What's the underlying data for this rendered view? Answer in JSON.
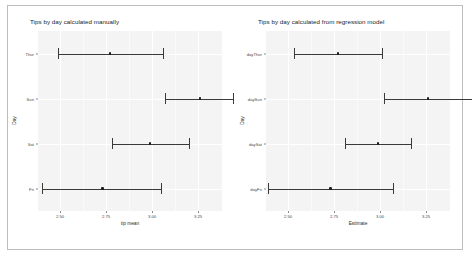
{
  "figure": {
    "background_color": "#ffffff",
    "border_color": "#bdbdbd",
    "panel_color": "#f4f4f4",
    "marker_color": "#1c1c1c",
    "line_color": "#3a3a3a"
  },
  "chart_data": [
    {
      "type": "scatter",
      "id": "manual",
      "title": "Tips by day calculated manually",
      "xlabel": "tip mean",
      "ylabel": "Day",
      "xlim": [
        2.38,
        3.38
      ],
      "grid": true,
      "legend": null,
      "xticks": [
        "2.50",
        "2.75",
        "3.00",
        "3.25"
      ],
      "xtick_values": [
        2.5,
        2.75,
        3.0,
        3.25
      ],
      "categories": [
        "Thur",
        "Sun",
        "Sat",
        "Fri"
      ],
      "series": [
        {
          "name": "tip mean with 95% CI",
          "points": [
            {
              "category": "Thur",
              "estimate": 2.77,
              "low": 2.49,
              "high": 3.06
            },
            {
              "category": "Sun",
              "estimate": 3.26,
              "low": 3.07,
              "high": 3.44
            },
            {
              "category": "Sat",
              "estimate": 2.99,
              "low": 2.78,
              "high": 3.2
            },
            {
              "category": "Fri",
              "estimate": 2.73,
              "low": 2.4,
              "high": 3.05
            }
          ]
        }
      ]
    },
    {
      "type": "scatter",
      "id": "regression",
      "title": "Tips by day calculated from regression model",
      "xlabel": "Estimate",
      "ylabel": "Day",
      "xlim": [
        2.38,
        3.38
      ],
      "grid": true,
      "legend": null,
      "xticks": [
        "2.50",
        "2.75",
        "3.00",
        "3.25"
      ],
      "xtick_values": [
        2.5,
        2.75,
        3.0,
        3.25
      ],
      "categories": [
        "dayThur",
        "daySun",
        "daySat",
        "dayFri"
      ],
      "series": [
        {
          "name": "Estimate with 95% CI",
          "points": [
            {
              "category": "dayThur",
              "estimate": 2.77,
              "low": 2.53,
              "high": 3.01
            },
            {
              "category": "daySun",
              "estimate": 3.26,
              "low": 3.02,
              "high": 3.5
            },
            {
              "category": "daySat",
              "estimate": 2.99,
              "low": 2.81,
              "high": 3.17
            },
            {
              "category": "dayFri",
              "estimate": 2.73,
              "low": 2.39,
              "high": 3.07
            }
          ]
        }
      ]
    }
  ]
}
